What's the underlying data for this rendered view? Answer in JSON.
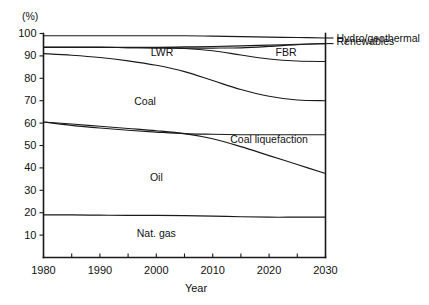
{
  "chart_data": {
    "type": "area",
    "title": "",
    "subtitle": "",
    "xlabel": "Year",
    "ylabel": "",
    "yunit": "(%)",
    "xlim": [
      1980,
      2030
    ],
    "ylim": [
      0,
      100
    ],
    "grid": false,
    "legend_position": "inline-and-right-edge",
    "x": [
      1980,
      1985,
      1990,
      1995,
      2000,
      2005,
      2010,
      2015,
      2020,
      2025,
      2030
    ],
    "xticks_major": [
      1980,
      1990,
      2000,
      2010,
      2020,
      2030
    ],
    "xticks_minor": [
      1985,
      1995,
      2005,
      2015,
      2025
    ],
    "xtick_labels": [
      "1980",
      "1990",
      "2000",
      "2010",
      "2020",
      "2030"
    ],
    "yticks": [
      10,
      20,
      30,
      40,
      50,
      60,
      70,
      80,
      90,
      100
    ],
    "ytick_labels": [
      "10",
      "20",
      "30",
      "40",
      "50",
      "60",
      "70",
      "80",
      "90",
      "100"
    ],
    "note": "Cumulative stacked share boundaries; each series value is the upper boundary of its band, in percent.",
    "series": [
      {
        "name": "Nat. gas",
        "label": "Nat. gas",
        "label_type": "inline",
        "label_x": 2000,
        "label_y": 9,
        "boundary_values": [
          19.0,
          19.0,
          18.9,
          18.8,
          18.8,
          18.7,
          18.5,
          18.2,
          18.0,
          18.0,
          18.0
        ]
      },
      {
        "name": "Oil",
        "label": "Oil",
        "label_type": "inline",
        "label_x": 2000,
        "label_y": 34,
        "boundary_values": [
          60.5,
          59.6,
          58.6,
          57.6,
          56.6,
          55.3,
          53.0,
          49.5,
          45.5,
          41.5,
          37.5
        ]
      },
      {
        "name": "Coal liquefaction",
        "label": "Coal liquefaction",
        "label_type": "inline",
        "label_x": 2020,
        "label_y": 51,
        "boundary_values": [
          60.5,
          59.0,
          57.8,
          56.8,
          56.0,
          55.3,
          55.0,
          54.8,
          54.8,
          54.8,
          54.8
        ]
      },
      {
        "name": "Coal",
        "label": "Coal",
        "label_type": "inline",
        "label_x": 1998,
        "label_y": 68,
        "boundary_values": [
          91.0,
          90.3,
          89.3,
          87.8,
          85.8,
          83.0,
          79.0,
          75.0,
          72.0,
          70.3,
          70.0
        ]
      },
      {
        "name": "LWR",
        "label": "LWR",
        "label_type": "inline",
        "label_x": 2001,
        "label_y": 90,
        "boundary_values": [
          93.8,
          93.8,
          93.8,
          93.7,
          93.6,
          93.3,
          92.3,
          90.4,
          88.6,
          87.7,
          87.5
        ]
      },
      {
        "name": "FBR",
        "label": "FBR",
        "label_type": "inline",
        "label_x": 2023,
        "label_y": 90,
        "boundary_values": [
          93.8,
          93.8,
          93.8,
          93.7,
          93.6,
          93.5,
          93.5,
          93.6,
          94.2,
          95.0,
          95.5
        ]
      },
      {
        "name": "Hydro/geothermal",
        "label": "Hydro/geothermal",
        "label_type": "right-edge",
        "boundary_values": [
          93.8,
          93.8,
          93.8,
          93.8,
          93.8,
          94.0,
          94.2,
          94.5,
          94.8,
          95.2,
          95.5
        ]
      },
      {
        "name": "Renewables",
        "label": "Renewables",
        "label_type": "right-edge",
        "boundary_values": [
          99.0,
          99.0,
          99.0,
          99.0,
          99.0,
          99.0,
          98.8,
          98.6,
          98.4,
          98.2,
          98.0
        ]
      }
    ],
    "right_edge_labels": [
      "Renewables",
      "Hydro/geothermal"
    ],
    "inline_labels": [
      "LWR",
      "FBR",
      "Coal",
      "Coal liquefaction",
      "Oil",
      "Nat. gas"
    ],
    "colors": {
      "axis": "#1a1a1a",
      "curve": "#1a1a1a",
      "text": "#111111",
      "background": "#ffffff"
    }
  }
}
